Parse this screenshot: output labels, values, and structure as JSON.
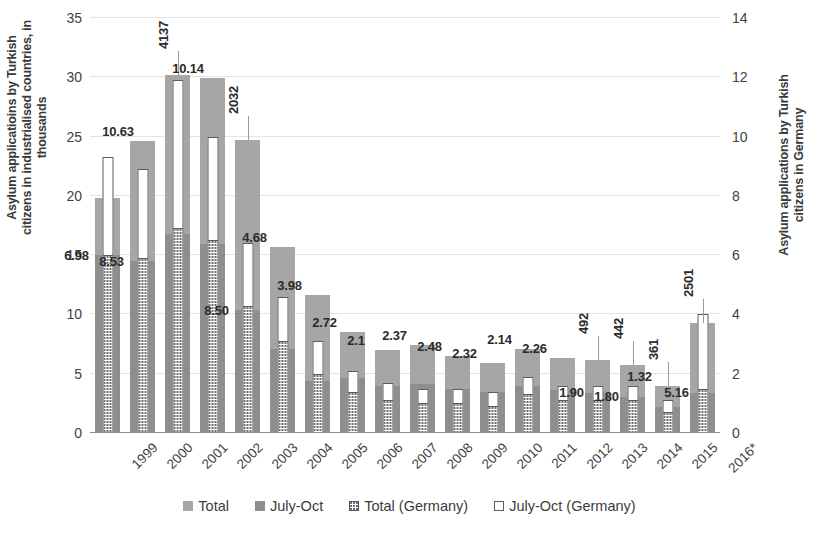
{
  "chart_data": {
    "type": "bar",
    "title": "",
    "subtitle": "",
    "xlabel": "",
    "ylabel": "Asylum applicatioins by Turkish citizens in industrialised countries, in thousands",
    "ylabel_right": "Asylum applications by Turkish citizens in Germany",
    "ylim": [
      0,
      35
    ],
    "ylim_right": [
      0,
      14
    ],
    "yticks": [
      "0",
      "5",
      "10",
      "15",
      "20",
      "25",
      "30",
      "35"
    ],
    "yticks_right": [
      "0",
      "2",
      "4",
      "6",
      "8",
      "10",
      "12",
      "14"
    ],
    "grid": true,
    "legend_position": "bottom",
    "categories": [
      "1999",
      "2000",
      "2001",
      "2002",
      "2003",
      "2004",
      "2005",
      "2006",
      "2007",
      "2008",
      "2009",
      "2010",
      "2011",
      "2012",
      "2013",
      "2014",
      "2015",
      "2016*"
    ],
    "series": [
      {
        "name": "Total",
        "axis": "left",
        "units": "thousands",
        "values": [
          19.8,
          24.6,
          30.2,
          29.9,
          24.7,
          15.7,
          11.6,
          8.5,
          7.0,
          7.4,
          6.5,
          5.9,
          7.1,
          6.3,
          6.2,
          5.7,
          4.0,
          9.3
        ]
      },
      {
        "name": "July-Oct",
        "axis": "left",
        "units": "thousands",
        "values": [
          15.0,
          14.5,
          16.8,
          15.9,
          10.4,
          7.1,
          4.4,
          4.6,
          4.0,
          4.1,
          3.7,
          3.5,
          4.0,
          3.6,
          3.4,
          3.0,
          2.2,
          3.4
        ]
      },
      {
        "name": "Total (Germany)",
        "axis": "right",
        "units": "applications",
        "values": [
          9.3,
          8.9,
          11.9,
          10.0,
          6.4,
          4.6,
          3.1,
          2.1,
          1.7,
          1.5,
          1.5,
          1.4,
          1.9,
          1.6,
          1.6,
          1.6,
          1.1,
          4.0
        ]
      },
      {
        "name": "July-Oct (Germany)",
        "axis": "right",
        "units": "applications",
        "values": [
          6.0,
          5.9,
          6.9,
          6.5,
          4.3,
          3.1,
          2.0,
          1.4,
          1.1,
          1.0,
          1.0,
          0.9,
          1.3,
          1.1,
          1.1,
          1.1,
          0.7,
          1.5
        ]
      }
    ],
    "bar_labels": [
      {
        "category": "1999",
        "text": "6.98",
        "rotated": false,
        "leader": false
      },
      {
        "category": "2000",
        "text": "8.53",
        "rotated": false,
        "leader": false
      },
      {
        "category": "2000b",
        "text": "10.63",
        "rotated": false,
        "leader": false
      },
      {
        "category": "2001",
        "text": "4137",
        "rotated": true,
        "leader": true
      },
      {
        "category": "2002",
        "text": "10.14",
        "rotated": false,
        "leader": false
      },
      {
        "category": "2003",
        "text": "2032",
        "rotated": true,
        "leader": true
      },
      {
        "category": "2003b",
        "text": "8.50",
        "rotated": false,
        "leader": false
      },
      {
        "category": "2004",
        "text": "4.68",
        "rotated": false,
        "leader": false
      },
      {
        "category": "2005",
        "text": "3.98",
        "rotated": false,
        "leader": false
      },
      {
        "category": "2006",
        "text": "2.72",
        "rotated": false,
        "leader": false
      },
      {
        "category": "2007",
        "text": "2.1",
        "rotated": false,
        "leader": false
      },
      {
        "category": "2008",
        "text": "2.37",
        "rotated": false,
        "leader": false
      },
      {
        "category": "2009",
        "text": "2.48",
        "rotated": false,
        "leader": false
      },
      {
        "category": "2010",
        "text": "2.32",
        "rotated": false,
        "leader": false
      },
      {
        "category": "2011",
        "text": "2.14",
        "rotated": false,
        "leader": false
      },
      {
        "category": "2012",
        "text": "2.26",
        "rotated": false,
        "leader": false
      },
      {
        "category": "2013",
        "text": "492",
        "rotated": true,
        "leader": true
      },
      {
        "category": "2013b",
        "text": "1.90",
        "rotated": false,
        "leader": false
      },
      {
        "category": "2014",
        "text": "442",
        "rotated": true,
        "leader": true
      },
      {
        "category": "2014b",
        "text": "1.80",
        "rotated": false,
        "leader": false
      },
      {
        "category": "2015",
        "text": "361",
        "rotated": true,
        "leader": true
      },
      {
        "category": "2015b",
        "text": "1.32",
        "rotated": false,
        "leader": false
      },
      {
        "category": "2016*",
        "text": "2501",
        "rotated": true,
        "leader": true
      },
      {
        "category": "2016b",
        "text": "5.16",
        "rotated": false,
        "leader": false
      }
    ],
    "legend": [
      {
        "label": "Total",
        "swatch": "solid-light-gray"
      },
      {
        "label": "July-Oct",
        "swatch": "solid-dark-gray"
      },
      {
        "label": "Total (Germany)",
        "swatch": "dotted-white"
      },
      {
        "label": "July-Oct (Germany)",
        "swatch": "outline-white"
      }
    ],
    "colors": {
      "total": "#a6a6a6",
      "july_oct": "#8e8e8e",
      "germany_outline": "#5c5c5c",
      "germany_fill": "#ffffff",
      "grid": "#e3e3e3",
      "text": "#3b3b3b"
    }
  }
}
